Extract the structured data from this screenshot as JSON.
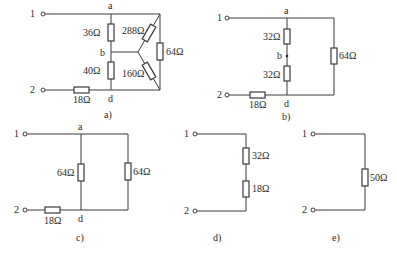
{
  "diagram": {
    "type": "circuit-equivalent-resistance-reduction",
    "panels": [
      {
        "id": "a",
        "caption": "a)",
        "terminals": [
          "1",
          "2"
        ],
        "nodes": [
          "a",
          "b",
          "d"
        ],
        "resistors": [
          {
            "label": "36Ω",
            "between": "a-b"
          },
          {
            "label": "40Ω",
            "between": "b-d"
          },
          {
            "label": "288Ω",
            "between": "a-star"
          },
          {
            "label": "160Ω",
            "between": "star-d"
          },
          {
            "label": "64Ω",
            "between": "a-d right branch"
          },
          {
            "label": "18Ω",
            "between": "2-d"
          }
        ]
      },
      {
        "id": "b",
        "caption": "b)",
        "terminals": [
          "1",
          "2"
        ],
        "nodes": [
          "a",
          "b",
          "d"
        ],
        "resistors": [
          {
            "label": "32Ω",
            "between": "a-b"
          },
          {
            "label": "32Ω",
            "between": "b-d"
          },
          {
            "label": "64Ω",
            "between": "a-d right branch"
          },
          {
            "label": "18Ω",
            "between": "2-d"
          }
        ]
      },
      {
        "id": "c",
        "caption": "c)",
        "terminals": [
          "1",
          "2"
        ],
        "nodes": [
          "a",
          "d"
        ],
        "resistors": [
          {
            "label": "64Ω",
            "between": "a-d"
          },
          {
            "label": "64Ω",
            "between": "a-d right branch"
          },
          {
            "label": "18Ω",
            "between": "2-d"
          }
        ]
      },
      {
        "id": "d",
        "caption": "d)",
        "terminals": [
          "1",
          "2"
        ],
        "resistors": [
          {
            "label": "32Ω"
          },
          {
            "label": "18Ω"
          }
        ]
      },
      {
        "id": "e",
        "caption": "e)",
        "terminals": [
          "1",
          "2"
        ],
        "resistors": [
          {
            "label": "50Ω"
          }
        ]
      }
    ]
  },
  "labels": {
    "t1": "1",
    "t2": "2",
    "a": "a",
    "b": "b",
    "d": "d",
    "pa": {
      "r36": "36Ω",
      "r40": "40Ω",
      "r288": "288Ω",
      "r160": "160Ω",
      "r64": "64Ω",
      "r18": "18Ω",
      "cap": "a)"
    },
    "pb": {
      "r32a": "32Ω",
      "r32b": "32Ω",
      "r64": "64Ω",
      "r18": "18Ω",
      "cap": "b)"
    },
    "pc": {
      "r64a": "64Ω",
      "r64b": "64Ω",
      "r18": "18Ω",
      "cap": "c)"
    },
    "pd": {
      "r32": "32Ω",
      "r18": "18Ω",
      "cap": "d)"
    },
    "pe": {
      "r50": "50Ω",
      "cap": "e)"
    }
  }
}
